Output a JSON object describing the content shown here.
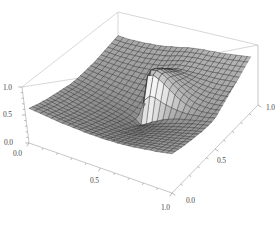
{
  "figure": {
    "kind": "surface-plot-3d",
    "background": "#ffffff",
    "frame_color": "#bdbdbd",
    "mesh_color": "#1a1a1a",
    "tick_text_color": "#4a4a4a"
  },
  "axes": {
    "z_axis": {
      "name": "vertical-left-axis",
      "ticks": [
        {
          "label": "1.0",
          "value": 1.0
        },
        {
          "label": "0.5",
          "value": 0.5
        },
        {
          "label": "0.0",
          "value": 0.0
        }
      ]
    },
    "x_axis": {
      "name": "front-left-axis",
      "ticks": [
        {
          "label": "0.0",
          "value": 0.0
        },
        {
          "label": "0.5",
          "value": 0.5
        },
        {
          "label": "1.0",
          "value": 1.0
        }
      ]
    },
    "y_axis": {
      "name": "front-right-axis",
      "ticks": [
        {
          "label": "0.0",
          "value": 0.0
        },
        {
          "label": "0.5",
          "value": 0.5
        },
        {
          "label": "1.0",
          "value": 1.0
        }
      ]
    }
  },
  "caption": {
    "text": ""
  },
  "chart_data": {
    "type": "surface",
    "title": "",
    "xlabel": "",
    "ylabel": "",
    "zlabel": "",
    "xlim": [
      0.0,
      1.0
    ],
    "ylim": [
      0.0,
      1.0
    ],
    "zlim": [
      0.0,
      1.0
    ],
    "xticks": [
      0.0,
      0.5,
      1.0
    ],
    "yticks": [
      0.0,
      0.5,
      1.0
    ],
    "zticks": [
      0.0,
      0.5,
      1.0
    ],
    "grid": true,
    "legend": false,
    "mesh_divisions_x": 26,
    "mesh_divisions_y": 26,
    "colormap": "grayscale",
    "singularity": {
      "x": 0.5,
      "y": 0.5
    },
    "surface_z": [
      [
        0.62,
        0.6,
        0.58,
        0.56,
        0.55,
        0.53,
        0.52,
        0.51,
        0.5,
        0.49,
        0.48,
        0.47,
        0.46,
        0.46,
        0.46,
        0.47,
        0.48,
        0.49,
        0.5,
        0.51,
        0.53,
        0.55,
        0.57,
        0.59,
        0.61,
        0.63,
        0.65
      ],
      [
        0.61,
        0.59,
        0.57,
        0.55,
        0.53,
        0.52,
        0.5,
        0.49,
        0.48,
        0.47,
        0.46,
        0.45,
        0.44,
        0.44,
        0.44,
        0.45,
        0.46,
        0.47,
        0.49,
        0.5,
        0.52,
        0.54,
        0.56,
        0.58,
        0.6,
        0.62,
        0.64
      ],
      [
        0.6,
        0.58,
        0.56,
        0.54,
        0.52,
        0.5,
        0.49,
        0.47,
        0.46,
        0.45,
        0.44,
        0.43,
        0.42,
        0.42,
        0.42,
        0.43,
        0.44,
        0.46,
        0.47,
        0.49,
        0.51,
        0.53,
        0.55,
        0.57,
        0.59,
        0.61,
        0.63
      ],
      [
        0.59,
        0.57,
        0.55,
        0.52,
        0.5,
        0.48,
        0.47,
        0.45,
        0.44,
        0.43,
        0.42,
        0.41,
        0.4,
        0.4,
        0.4,
        0.41,
        0.42,
        0.44,
        0.46,
        0.48,
        0.5,
        0.52,
        0.54,
        0.56,
        0.59,
        0.61,
        0.63
      ],
      [
        0.58,
        0.56,
        0.53,
        0.51,
        0.49,
        0.47,
        0.45,
        0.43,
        0.42,
        0.41,
        0.4,
        0.39,
        0.38,
        0.38,
        0.38,
        0.39,
        0.41,
        0.43,
        0.45,
        0.47,
        0.49,
        0.51,
        0.54,
        0.56,
        0.58,
        0.61,
        0.63
      ],
      [
        0.57,
        0.55,
        0.52,
        0.5,
        0.47,
        0.45,
        0.43,
        0.42,
        0.4,
        0.39,
        0.38,
        0.37,
        0.36,
        0.36,
        0.36,
        0.38,
        0.39,
        0.41,
        0.44,
        0.46,
        0.48,
        0.51,
        0.53,
        0.56,
        0.58,
        0.61,
        0.63
      ],
      [
        0.56,
        0.54,
        0.51,
        0.49,
        0.46,
        0.44,
        0.42,
        0.4,
        0.38,
        0.37,
        0.36,
        0.35,
        0.34,
        0.34,
        0.34,
        0.36,
        0.38,
        0.4,
        0.43,
        0.45,
        0.48,
        0.5,
        0.53,
        0.56,
        0.58,
        0.61,
        0.64
      ],
      [
        0.56,
        0.53,
        0.5,
        0.48,
        0.45,
        0.43,
        0.41,
        0.39,
        0.37,
        0.35,
        0.34,
        0.33,
        0.32,
        0.32,
        0.33,
        0.34,
        0.36,
        0.39,
        0.42,
        0.45,
        0.48,
        0.5,
        0.53,
        0.56,
        0.59,
        0.62,
        0.64
      ],
      [
        0.55,
        0.52,
        0.5,
        0.47,
        0.44,
        0.42,
        0.39,
        0.37,
        0.35,
        0.34,
        0.32,
        0.31,
        0.3,
        0.3,
        0.31,
        0.33,
        0.35,
        0.38,
        0.41,
        0.44,
        0.47,
        0.51,
        0.54,
        0.57,
        0.6,
        0.63,
        0.65
      ],
      [
        0.55,
        0.52,
        0.49,
        0.46,
        0.43,
        0.41,
        0.38,
        0.36,
        0.34,
        0.32,
        0.3,
        0.29,
        0.28,
        0.28,
        0.29,
        0.31,
        0.34,
        0.37,
        0.41,
        0.44,
        0.48,
        0.51,
        0.55,
        0.58,
        0.61,
        0.64,
        0.66
      ],
      [
        0.54,
        0.51,
        0.48,
        0.45,
        0.42,
        0.4,
        0.37,
        0.35,
        0.32,
        0.3,
        0.28,
        0.27,
        0.26,
        0.26,
        0.27,
        0.3,
        0.33,
        0.37,
        0.41,
        0.45,
        0.49,
        0.52,
        0.56,
        0.59,
        0.62,
        0.65,
        0.68
      ],
      [
        0.54,
        0.51,
        0.48,
        0.45,
        0.42,
        0.39,
        0.36,
        0.33,
        0.31,
        0.28,
        0.26,
        0.24,
        0.23,
        0.24,
        0.26,
        0.29,
        0.33,
        0.37,
        0.42,
        0.46,
        0.5,
        0.54,
        0.58,
        0.61,
        0.64,
        0.67,
        0.69
      ],
      [
        0.54,
        0.51,
        0.47,
        0.44,
        0.41,
        0.38,
        0.35,
        0.32,
        0.29,
        0.26,
        0.23,
        0.21,
        0.19,
        0.21,
        0.25,
        0.3,
        0.35,
        0.4,
        0.45,
        0.49,
        0.54,
        0.57,
        0.61,
        0.64,
        0.67,
        0.69,
        0.71
      ],
      [
        0.54,
        0.5,
        0.47,
        0.44,
        0.41,
        0.38,
        0.34,
        0.31,
        0.27,
        0.24,
        0.2,
        0.16,
        0.11,
        0.5,
        0.88,
        0.93,
        0.9,
        0.85,
        0.8,
        0.74,
        0.68,
        0.63,
        0.64,
        0.66,
        0.69,
        0.71,
        0.73
      ],
      [
        0.54,
        0.51,
        0.47,
        0.44,
        0.41,
        0.38,
        0.34,
        0.31,
        0.27,
        0.24,
        0.21,
        0.18,
        0.16,
        0.6,
        0.92,
        0.95,
        0.92,
        0.87,
        0.81,
        0.75,
        0.69,
        0.65,
        0.66,
        0.68,
        0.7,
        0.72,
        0.74
      ],
      [
        0.55,
        0.51,
        0.48,
        0.45,
        0.42,
        0.39,
        0.35,
        0.32,
        0.29,
        0.26,
        0.24,
        0.22,
        0.22,
        0.6,
        0.88,
        0.92,
        0.89,
        0.84,
        0.79,
        0.74,
        0.69,
        0.66,
        0.67,
        0.69,
        0.71,
        0.73,
        0.75
      ],
      [
        0.55,
        0.52,
        0.49,
        0.46,
        0.43,
        0.4,
        0.37,
        0.34,
        0.31,
        0.29,
        0.27,
        0.26,
        0.27,
        0.56,
        0.82,
        0.86,
        0.84,
        0.8,
        0.76,
        0.72,
        0.68,
        0.66,
        0.68,
        0.7,
        0.72,
        0.74,
        0.76
      ],
      [
        0.56,
        0.53,
        0.5,
        0.47,
        0.44,
        0.42,
        0.39,
        0.36,
        0.34,
        0.32,
        0.31,
        0.3,
        0.32,
        0.53,
        0.75,
        0.79,
        0.78,
        0.75,
        0.72,
        0.69,
        0.67,
        0.66,
        0.68,
        0.7,
        0.72,
        0.74,
        0.76
      ],
      [
        0.57,
        0.54,
        0.51,
        0.49,
        0.46,
        0.44,
        0.41,
        0.39,
        0.37,
        0.35,
        0.34,
        0.34,
        0.36,
        0.51,
        0.68,
        0.72,
        0.72,
        0.7,
        0.68,
        0.67,
        0.66,
        0.66,
        0.68,
        0.7,
        0.72,
        0.74,
        0.77
      ],
      [
        0.58,
        0.56,
        0.53,
        0.51,
        0.48,
        0.46,
        0.44,
        0.42,
        0.4,
        0.38,
        0.37,
        0.37,
        0.39,
        0.49,
        0.62,
        0.66,
        0.66,
        0.66,
        0.65,
        0.65,
        0.65,
        0.66,
        0.68,
        0.7,
        0.73,
        0.75,
        0.77
      ],
      [
        0.6,
        0.57,
        0.55,
        0.52,
        0.5,
        0.48,
        0.46,
        0.44,
        0.42,
        0.41,
        0.4,
        0.4,
        0.42,
        0.48,
        0.57,
        0.61,
        0.62,
        0.62,
        0.63,
        0.63,
        0.65,
        0.66,
        0.68,
        0.71,
        0.73,
        0.76,
        0.78
      ],
      [
        0.61,
        0.59,
        0.57,
        0.54,
        0.52,
        0.5,
        0.48,
        0.46,
        0.45,
        0.43,
        0.43,
        0.43,
        0.44,
        0.48,
        0.54,
        0.57,
        0.59,
        0.6,
        0.61,
        0.62,
        0.64,
        0.66,
        0.69,
        0.71,
        0.74,
        0.76,
        0.79
      ],
      [
        0.63,
        0.61,
        0.58,
        0.56,
        0.54,
        0.52,
        0.5,
        0.49,
        0.47,
        0.46,
        0.45,
        0.45,
        0.46,
        0.49,
        0.53,
        0.55,
        0.57,
        0.58,
        0.6,
        0.61,
        0.64,
        0.66,
        0.69,
        0.72,
        0.74,
        0.77,
        0.8
      ],
      [
        0.64,
        0.62,
        0.6,
        0.58,
        0.56,
        0.54,
        0.52,
        0.51,
        0.49,
        0.48,
        0.48,
        0.48,
        0.48,
        0.5,
        0.52,
        0.54,
        0.56,
        0.58,
        0.6,
        0.62,
        0.64,
        0.67,
        0.7,
        0.72,
        0.75,
        0.78,
        0.81
      ],
      [
        0.66,
        0.64,
        0.62,
        0.6,
        0.58,
        0.56,
        0.55,
        0.53,
        0.52,
        0.51,
        0.5,
        0.5,
        0.5,
        0.51,
        0.53,
        0.54,
        0.56,
        0.58,
        0.6,
        0.62,
        0.65,
        0.68,
        0.7,
        0.73,
        0.76,
        0.79,
        0.82
      ],
      [
        0.68,
        0.66,
        0.64,
        0.62,
        0.6,
        0.58,
        0.57,
        0.55,
        0.54,
        0.53,
        0.52,
        0.52,
        0.52,
        0.53,
        0.54,
        0.55,
        0.57,
        0.59,
        0.61,
        0.63,
        0.66,
        0.68,
        0.71,
        0.74,
        0.77,
        0.8,
        0.83
      ],
      [
        0.7,
        0.68,
        0.66,
        0.64,
        0.62,
        0.61,
        0.59,
        0.58,
        0.57,
        0.55,
        0.55,
        0.54,
        0.54,
        0.55,
        0.56,
        0.57,
        0.58,
        0.6,
        0.62,
        0.65,
        0.67,
        0.7,
        0.73,
        0.76,
        0.79,
        0.82,
        0.85
      ]
    ]
  }
}
